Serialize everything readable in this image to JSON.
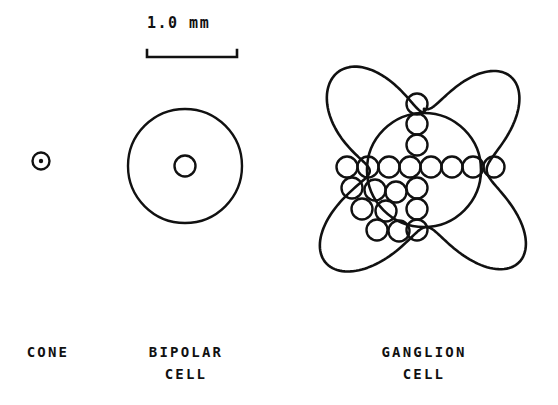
{
  "figure": {
    "title_present": false,
    "background_color": "#ffffff",
    "stroke_color": "#111111",
    "scale_bar": {
      "label": "1.0 mm",
      "x_start": 147,
      "x_end": 237,
      "y": 57,
      "tick_height": 7,
      "line_width": 2.4
    },
    "cells": [
      {
        "name": "cone",
        "label_lines": [
          "CONE"
        ],
        "center": {
          "x": 41,
          "y": 161
        },
        "outer_radius": 8.5,
        "inner_radius": 2.2,
        "inner_filled": true,
        "stroke_width": 2.4
      },
      {
        "name": "bipolar-cell",
        "label_lines": [
          "BIPOLAR",
          "CELL"
        ],
        "center": {
          "x": 185,
          "y": 166
        },
        "outer_radius": 57,
        "inner_radius": 10.5,
        "inner_filled": false,
        "stroke_width": 2.4
      },
      {
        "name": "ganglion-cell",
        "label_lines": [
          "GANGLION",
          "CELL"
        ],
        "center": {
          "x": 424,
          "y": 170
        },
        "soma_radius": 57,
        "stroke_width": 2.6,
        "dendritic_field": {
          "shape": "four-lobed-clover",
          "lobes": 4,
          "top_peak_y": 48,
          "bottom_y": 295,
          "left_x": 305,
          "right_x": 536
        },
        "vesicle_radius": 10.5,
        "vesicle_stroke_width": 2.4,
        "vesicles": [
          {
            "x": 417,
            "y": 104
          },
          {
            "x": 417,
            "y": 124
          },
          {
            "x": 417,
            "y": 145
          },
          {
            "x": 347,
            "y": 167
          },
          {
            "x": 368,
            "y": 167
          },
          {
            "x": 389,
            "y": 167
          },
          {
            "x": 410,
            "y": 167
          },
          {
            "x": 431,
            "y": 167
          },
          {
            "x": 452,
            "y": 167
          },
          {
            "x": 473,
            "y": 167
          },
          {
            "x": 494,
            "y": 167
          },
          {
            "x": 417,
            "y": 188
          },
          {
            "x": 417,
            "y": 209
          },
          {
            "x": 417,
            "y": 230
          },
          {
            "x": 352,
            "y": 188
          },
          {
            "x": 375,
            "y": 190
          },
          {
            "x": 396,
            "y": 192
          },
          {
            "x": 362,
            "y": 209
          },
          {
            "x": 386,
            "y": 211
          },
          {
            "x": 377,
            "y": 230
          },
          {
            "x": 399,
            "y": 231
          }
        ]
      }
    ]
  }
}
